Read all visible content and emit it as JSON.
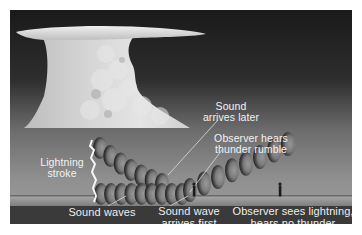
{
  "diagram": {
    "colors": {
      "sky_top": "#1c1c1c",
      "sky_horizon": "#8e8e8e",
      "cloud": "#d8d8d8",
      "ground": "#8a8a8a",
      "label_bar": "#3a3a3a",
      "text": "#f2f2f2",
      "lightning": "#f4f4f4"
    },
    "labels": {
      "sound_later": [
        "Sound",
        "arrives later"
      ],
      "observer_rumble": [
        "Observer hears",
        "thunder rumble"
      ],
      "lightning_stroke": [
        "Lightning",
        "stroke"
      ],
      "sound_waves": [
        "Sound waves"
      ],
      "sound_first": [
        "Sound wave",
        "arrives first"
      ],
      "observer_no_thunder": [
        "Observer sees lightning,",
        "hears no thunder"
      ]
    },
    "elements": {
      "cloud": "cumulonimbus-anvil-cloud",
      "lightning": "lightning-bolt",
      "wave_groups": [
        {
          "name": "upper-wave-path",
          "count": 7
        },
        {
          "name": "lower-wave-path",
          "count": 9
        },
        {
          "name": "rising-wave-path",
          "count": 8
        }
      ],
      "observers": [
        {
          "name": "observer-near",
          "description": "Observer hears thunder rumble"
        },
        {
          "name": "observer-far",
          "description": "Observer sees lightning, hears no thunder"
        }
      ]
    }
  }
}
